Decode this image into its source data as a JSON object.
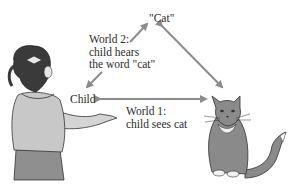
{
  "diagram": {
    "nodes": {
      "word": {
        "label": "\"Cat\""
      },
      "child": {
        "label": "Child"
      },
      "cat": {
        "label": "cat illustration"
      }
    },
    "edges": {
      "world2": {
        "from": "child",
        "to": "word",
        "label_lines": [
          "World 2:",
          "child hears",
          "the word \"cat\""
        ]
      },
      "world1": {
        "from": "child",
        "to": "cat",
        "label_lines": [
          "World 1:",
          "child sees cat"
        ]
      },
      "word_cat": {
        "from": "word",
        "to": "cat",
        "label_lines": []
      }
    },
    "colors": {
      "arrow": "#8c8c8c",
      "text": "#2a2a2a",
      "cat_fur": "#8a8a8a",
      "child_shirt": "#c8c8c8",
      "child_skirt": "#8f8f8f",
      "child_hair": "#3a3a3a"
    }
  }
}
